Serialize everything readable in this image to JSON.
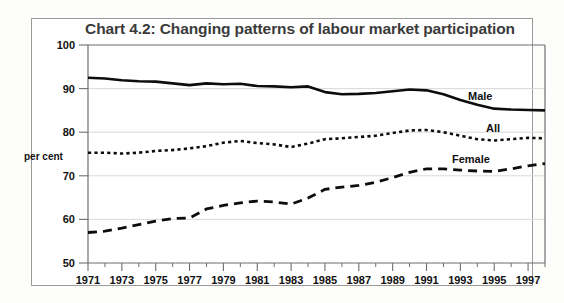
{
  "figure": {
    "title": "Chart 4.2: Changing patterns of labour market participation"
  },
  "axes": {
    "ylabel": "per cent",
    "y_ticks": [
      "50",
      "60",
      "70",
      "80",
      "90",
      "100"
    ],
    "x_ticks": [
      "1971",
      "1973",
      "1975",
      "1977",
      "1979",
      "1981",
      "1983",
      "1985",
      "1987",
      "1989",
      "1991",
      "1993",
      "1995",
      "1997"
    ]
  },
  "series_labels": {
    "male": "Male",
    "all": "All",
    "female": "Female"
  },
  "colors": {
    "line": "#0d0d0d",
    "grid": "#d9d9d9",
    "axis": "#6f6f6f",
    "title": "#3b3b3b",
    "frame": "#9a9a96",
    "background": "#ffffff"
  },
  "chart_data": {
    "type": "line",
    "title": "Chart 4.2: Changing patterns of labour market participation",
    "xlabel": "",
    "ylabel": "per cent",
    "xlim": [
      1971,
      1998
    ],
    "ylim": [
      50,
      100
    ],
    "grid": true,
    "legend": "inline-right",
    "x": [
      1971,
      1972,
      1973,
      1974,
      1975,
      1976,
      1977,
      1978,
      1979,
      1980,
      1981,
      1982,
      1983,
      1984,
      1985,
      1986,
      1987,
      1988,
      1989,
      1990,
      1991,
      1992,
      1993,
      1994,
      1995,
      1996,
      1997,
      1998
    ],
    "series": [
      {
        "name": "Male",
        "style": "solid",
        "values": [
          92.5,
          92.3,
          91.9,
          91.7,
          91.6,
          91.2,
          90.8,
          91.2,
          91.0,
          91.1,
          90.6,
          90.5,
          90.3,
          90.5,
          89.2,
          88.7,
          88.8,
          89.0,
          89.4,
          89.8,
          89.6,
          88.7,
          87.4,
          86.3,
          85.4,
          85.2,
          85.1,
          85.0
        ]
      },
      {
        "name": "All",
        "style": "dotted",
        "values": [
          75.3,
          75.3,
          75.1,
          75.3,
          75.7,
          75.9,
          76.3,
          76.8,
          77.6,
          78.0,
          77.5,
          77.2,
          76.6,
          77.4,
          78.4,
          78.6,
          78.9,
          79.2,
          79.8,
          80.4,
          80.5,
          80.0,
          79.2,
          78.4,
          78.1,
          78.4,
          78.7,
          78.6
        ]
      },
      {
        "name": "Female",
        "style": "dashed",
        "values": [
          57.0,
          57.3,
          58.0,
          58.8,
          59.6,
          60.2,
          60.3,
          62.4,
          63.2,
          63.8,
          64.2,
          64.0,
          63.5,
          64.9,
          66.9,
          67.4,
          67.8,
          68.5,
          69.6,
          70.8,
          71.6,
          71.6,
          71.3,
          71.1,
          71.0,
          71.6,
          72.3,
          72.8
        ]
      }
    ]
  }
}
